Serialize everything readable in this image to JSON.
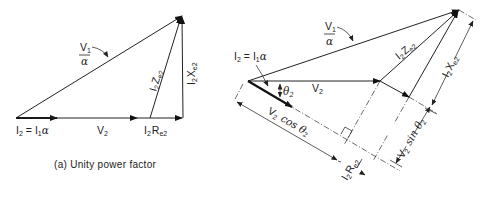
{
  "diagram_a": {
    "caption": "(a) Unity power factor",
    "labels": {
      "v1_num": "V",
      "v1_num_sub": "1",
      "v1_den": "α",
      "i2": "I",
      "i2_sub": "2",
      "i2_eq": "= I",
      "i2_eq_sub": "1",
      "i2_alpha": "α",
      "v2": "V",
      "v2_sub": "2",
      "i2re2": "I",
      "i2re2_sub1": "2",
      "i2re2_r": "R",
      "i2re2_sub2": "e2",
      "i2ze2": "I",
      "i2ze2_sub1": "2",
      "i2ze2_z": "Z",
      "i2ze2_sub2": "e2",
      "i2xe2": "I",
      "i2xe2_sub1": "2",
      "i2xe2_x": "X",
      "i2xe2_sub2": "e2"
    }
  },
  "diagram_b": {
    "labels": {
      "v1_num": "V",
      "v1_num_sub": "1",
      "v1_den": "α",
      "i2": "I",
      "i2_sub": "2",
      "i2_eq": "= I",
      "i2_eq_sub": "1",
      "i2_alpha": "α",
      "theta": "θ",
      "theta_sub": "2",
      "v2": "V",
      "v2_sub": "2",
      "i2ze2": "I",
      "i2ze2_sub1": "2",
      "i2ze2_z": "Z",
      "i2ze2_sub2": "e2",
      "i2xe2": "I",
      "i2xe2_sub1": "2",
      "i2xe2_x": "X",
      "i2xe2_sub2": "e2",
      "v2cos": "V",
      "v2cos_sub": "2",
      "v2cos_fn": "cos θ",
      "v2cos_sub2": "2",
      "v2sin": "V",
      "v2sin_sub": "2",
      "v2sin_fn": "sin θ",
      "v2sin_sub2": "2",
      "i2re2": "I",
      "i2re2_sub1": "2",
      "i2re2_r": "R",
      "i2re2_sub2": "e2"
    }
  }
}
